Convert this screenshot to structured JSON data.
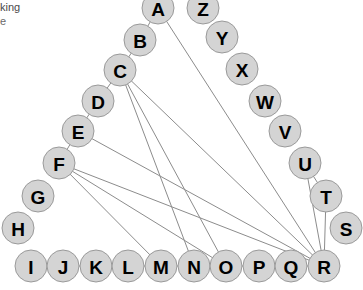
{
  "caption": {
    "line1": "king",
    "line2": "e"
  },
  "graph": {
    "type": "node-link-diagram",
    "node_radius": 16,
    "node_fill": "#d4d4d4",
    "node_stroke": "#9a9a9a",
    "edge_color": "#8c8c8c",
    "background": "#ffffff",
    "nodes": [
      {
        "id": "A",
        "label": "A",
        "x": 158,
        "y": 8
      },
      {
        "id": "Z",
        "label": "Z",
        "x": 203,
        "y": 8
      },
      {
        "id": "B",
        "label": "B",
        "x": 140,
        "y": 40
      },
      {
        "id": "Y",
        "label": "Y",
        "x": 222,
        "y": 37
      },
      {
        "id": "C",
        "label": "C",
        "x": 120,
        "y": 70
      },
      {
        "id": "X",
        "label": "X",
        "x": 242,
        "y": 69
      },
      {
        "id": "D",
        "label": "D",
        "x": 98,
        "y": 101
      },
      {
        "id": "W",
        "label": "W",
        "x": 265,
        "y": 101
      },
      {
        "id": "E",
        "label": "E",
        "x": 78,
        "y": 131
      },
      {
        "id": "V",
        "label": "V",
        "x": 285,
        "y": 131
      },
      {
        "id": "F",
        "label": "F",
        "x": 59,
        "y": 163
      },
      {
        "id": "U",
        "label": "U",
        "x": 305,
        "y": 163
      },
      {
        "id": "G",
        "label": "G",
        "x": 38,
        "y": 196
      },
      {
        "id": "T",
        "label": "T",
        "x": 326,
        "y": 196
      },
      {
        "id": "H",
        "label": "H",
        "x": 18,
        "y": 228
      },
      {
        "id": "S",
        "label": "S",
        "x": 346,
        "y": 228
      },
      {
        "id": "I",
        "label": "I",
        "x": 31,
        "y": 266
      },
      {
        "id": "J",
        "label": "J",
        "x": 63,
        "y": 266
      },
      {
        "id": "K",
        "label": "K",
        "x": 96,
        "y": 266
      },
      {
        "id": "L",
        "label": "L",
        "x": 128,
        "y": 266
      },
      {
        "id": "M",
        "label": "M",
        "x": 161,
        "y": 266
      },
      {
        "id": "N",
        "label": "N",
        "x": 194,
        "y": 266
      },
      {
        "id": "O",
        "label": "O",
        "x": 226,
        "y": 266
      },
      {
        "id": "P",
        "label": "P",
        "x": 259,
        "y": 266
      },
      {
        "id": "Q",
        "label": "Q",
        "x": 291,
        "y": 266
      },
      {
        "id": "R",
        "label": "R",
        "x": 324,
        "y": 266
      }
    ],
    "edges": [
      {
        "source": "A",
        "target": "B"
      },
      {
        "source": "A",
        "target": "R"
      },
      {
        "source": "C",
        "target": "B"
      },
      {
        "source": "C",
        "target": "O"
      },
      {
        "source": "C",
        "target": "R"
      },
      {
        "source": "C",
        "target": "N"
      },
      {
        "source": "D",
        "target": "C"
      },
      {
        "source": "E",
        "target": "D"
      },
      {
        "source": "E",
        "target": "R"
      },
      {
        "source": "F",
        "target": "E"
      },
      {
        "source": "F",
        "target": "M"
      },
      {
        "source": "F",
        "target": "O"
      },
      {
        "source": "F",
        "target": "R"
      },
      {
        "source": "U",
        "target": "R"
      },
      {
        "source": "T",
        "target": "R"
      },
      {
        "source": "U",
        "target": "T"
      },
      {
        "source": "I",
        "target": "R"
      }
    ]
  }
}
